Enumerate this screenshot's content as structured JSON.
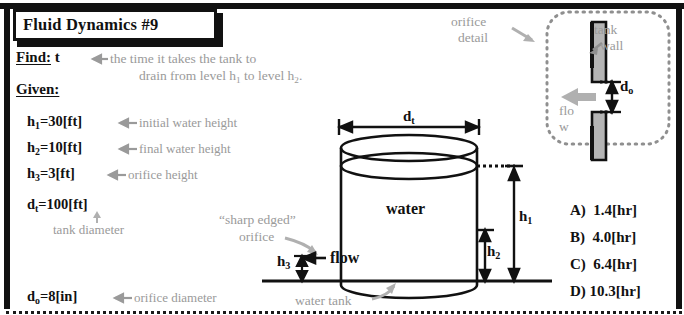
{
  "title": "Fluid Dynamics #9",
  "problem": {
    "find_label": "Find:",
    "find_symbol": " t",
    "find_annotation_line1": "the time it takes the tank to",
    "find_annotation_line2_a": "drain from level h",
    "find_annotation_line2_sub1": "1",
    "find_annotation_line2_b": " to level h",
    "find_annotation_line2_sub2": "2",
    "find_annotation_line2_c": ".",
    "given_label": "Given:"
  },
  "given": [
    {
      "symbol": "h",
      "sub": "1",
      "value": "=30[ft]",
      "annotation": "initial water height"
    },
    {
      "symbol": "h",
      "sub": "2",
      "value": "=10[ft]",
      "annotation": "final water height"
    },
    {
      "symbol": "h",
      "sub": "3",
      "value": "=3[ft]",
      "annotation": "orifice height"
    },
    {
      "symbol": "d",
      "sub": "t",
      "value": "=100[ft]",
      "annotation": "tank diameter"
    },
    {
      "symbol": "d",
      "sub": "o",
      "value": "=8[in]",
      "annotation": "orifice diameter"
    }
  ],
  "diagram": {
    "water_label": "water",
    "flow_label": "flow",
    "water_tank_label": "water tank",
    "sharp_edged_line1": "“sharp edged”",
    "sharp_edged_line2": "orifice",
    "dim_dt": "d",
    "dim_dt_sub": "t",
    "dim_h1": "h",
    "dim_h1_sub": "1",
    "dim_h2": "h",
    "dim_h2_sub": "2",
    "dim_h3": "h",
    "dim_h3_sub": "3"
  },
  "orifice_detail": {
    "label_line1": "orifice",
    "label_line2": "detail",
    "tank_wall_line1": "tank",
    "tank_wall_line2": "wall",
    "flow_line1": "flo",
    "flow_line2": "w",
    "dim_do": "d",
    "dim_do_sub": "o"
  },
  "answers": [
    {
      "key": "A)",
      "value": "1.4[hr]"
    },
    {
      "key": "B)",
      "value": "4.0[hr]"
    },
    {
      "key": "C)",
      "value": "6.4[hr]"
    },
    {
      "key": "D)",
      "value": "10.3[hr]"
    }
  ],
  "colors": {
    "ink": "#111111",
    "annotation_gray": "#9a9a9a",
    "wall_fill": "#b5b5b5"
  }
}
